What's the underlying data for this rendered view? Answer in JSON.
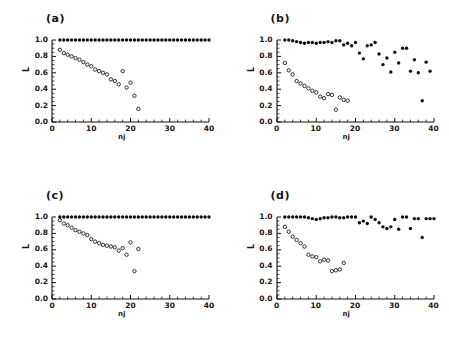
{
  "figure": {
    "background": "#ffffff",
    "marker_color": "#101010",
    "panels": [
      "a",
      "b",
      "c",
      "d"
    ]
  },
  "chart_data": [
    {
      "type": "scatter",
      "title": "(a)",
      "xlabel": "nj",
      "ylabel": "L",
      "xlim": [
        0,
        40
      ],
      "ylim": [
        0.0,
        1.0
      ],
      "xticks": [
        0,
        10,
        20,
        30,
        40
      ],
      "yticks": [
        "0.0",
        "0.2",
        "0.4",
        "0.6",
        "0.8",
        "1.0"
      ],
      "grid": false,
      "legend": "none",
      "series": [
        {
          "name": "filled",
          "marker": "filled-circle",
          "x": [
            2,
            3,
            4,
            5,
            6,
            7,
            8,
            9,
            10,
            11,
            12,
            13,
            14,
            15,
            16,
            17,
            18,
            19,
            20,
            21,
            22,
            23,
            24,
            25,
            26,
            27,
            28,
            29,
            30,
            31,
            32,
            33,
            34,
            35,
            36,
            37,
            38,
            39,
            40
          ],
          "y": [
            1.0,
            1.0,
            1.0,
            1.0,
            1.0,
            1.0,
            1.0,
            1.0,
            1.0,
            1.0,
            1.0,
            1.0,
            1.0,
            1.0,
            1.0,
            1.0,
            1.0,
            1.0,
            1.0,
            1.0,
            1.0,
            1.0,
            1.0,
            1.0,
            1.0,
            1.0,
            1.0,
            1.0,
            1.0,
            1.0,
            1.0,
            1.0,
            1.0,
            1.0,
            1.0,
            1.0,
            1.0,
            1.0,
            1.0
          ]
        },
        {
          "name": "open",
          "marker": "open-circle",
          "x": [
            2,
            3,
            4,
            5,
            6,
            7,
            8,
            9,
            10,
            11,
            12,
            13,
            14,
            15,
            16,
            17,
            18,
            19,
            20,
            21,
            22
          ],
          "y": [
            0.88,
            0.84,
            0.82,
            0.8,
            0.78,
            0.76,
            0.73,
            0.7,
            0.68,
            0.64,
            0.62,
            0.6,
            0.58,
            0.52,
            0.5,
            0.46,
            0.62,
            0.42,
            0.48,
            0.32,
            0.16
          ]
        }
      ]
    },
    {
      "type": "scatter",
      "title": "(b)",
      "xlabel": "nj",
      "ylabel": "L",
      "xlim": [
        0,
        40
      ],
      "ylim": [
        0.0,
        1.0
      ],
      "xticks": [
        0,
        10,
        20,
        30,
        40
      ],
      "yticks": [
        "0.0",
        "0.2",
        "0.4",
        "0.6",
        "0.8",
        "1.0"
      ],
      "grid": false,
      "legend": "none",
      "series": [
        {
          "name": "filled",
          "marker": "filled-circle",
          "x": [
            2,
            3,
            4,
            5,
            6,
            7,
            8,
            9,
            10,
            11,
            12,
            13,
            14,
            15,
            16,
            17,
            18,
            19,
            20,
            21,
            22,
            23,
            24,
            25,
            26,
            27,
            28,
            29,
            30,
            31,
            32,
            33,
            34,
            35,
            36,
            37,
            38,
            39
          ],
          "y": [
            1.0,
            1.0,
            0.99,
            0.98,
            0.97,
            0.96,
            0.97,
            0.97,
            0.96,
            0.97,
            0.97,
            0.98,
            0.97,
            0.99,
            0.99,
            0.94,
            0.96,
            0.93,
            0.97,
            0.84,
            0.77,
            0.93,
            0.94,
            0.97,
            0.83,
            0.7,
            0.78,
            0.61,
            0.85,
            0.72,
            0.9,
            0.9,
            0.62,
            0.76,
            0.6,
            0.26,
            0.73,
            0.62
          ]
        },
        {
          "name": "open",
          "marker": "open-circle",
          "x": [
            2,
            3,
            4,
            5,
            6,
            7,
            8,
            9,
            10,
            11,
            12,
            13,
            14,
            15,
            16,
            17,
            18
          ],
          "y": [
            0.72,
            0.63,
            0.58,
            0.5,
            0.47,
            0.44,
            0.41,
            0.38,
            0.36,
            0.31,
            0.29,
            0.34,
            0.33,
            0.15,
            0.3,
            0.27,
            0.26
          ]
        }
      ]
    },
    {
      "type": "scatter",
      "title": "(c)",
      "xlabel": "nj",
      "ylabel": "L",
      "xlim": [
        0,
        40
      ],
      "ylim": [
        0.0,
        1.0
      ],
      "xticks": [
        0,
        10,
        20,
        30,
        40
      ],
      "yticks": [
        "0.0",
        "0.2",
        "0.4",
        "0.6",
        "0.8",
        "1.0"
      ],
      "grid": false,
      "legend": "none",
      "series": [
        {
          "name": "filled",
          "marker": "filled-circle",
          "x": [
            2,
            3,
            4,
            5,
            6,
            7,
            8,
            9,
            10,
            11,
            12,
            13,
            14,
            15,
            16,
            17,
            18,
            19,
            20,
            21,
            22,
            23,
            24,
            25,
            26,
            27,
            28,
            29,
            30,
            31,
            32,
            33,
            34,
            35,
            36,
            37,
            38,
            39,
            40
          ],
          "y": [
            1.0,
            1.0,
            1.0,
            1.0,
            1.0,
            1.0,
            1.0,
            1.0,
            1.0,
            1.0,
            1.0,
            1.0,
            1.0,
            1.0,
            1.0,
            1.0,
            1.0,
            1.0,
            1.0,
            1.0,
            1.0,
            1.0,
            1.0,
            1.0,
            1.0,
            1.0,
            1.0,
            1.0,
            1.0,
            1.0,
            1.0,
            1.0,
            1.0,
            1.0,
            1.0,
            1.0,
            1.0,
            1.0,
            1.0
          ]
        },
        {
          "name": "open",
          "marker": "open-circle",
          "x": [
            2,
            3,
            4,
            5,
            6,
            7,
            8,
            9,
            10,
            11,
            12,
            13,
            14,
            15,
            16,
            17,
            18,
            19,
            20,
            21,
            22
          ],
          "y": [
            0.96,
            0.92,
            0.9,
            0.87,
            0.84,
            0.82,
            0.8,
            0.78,
            0.73,
            0.7,
            0.68,
            0.66,
            0.65,
            0.64,
            0.63,
            0.59,
            0.62,
            0.54,
            0.69,
            0.34,
            0.61
          ]
        }
      ]
    },
    {
      "type": "scatter",
      "title": "(d)",
      "xlabel": "nj",
      "ylabel": "L",
      "xlim": [
        0,
        40
      ],
      "ylim": [
        0.0,
        1.0
      ],
      "xticks": [
        0,
        10,
        20,
        30,
        40
      ],
      "yticks": [
        "0.0",
        "0.2",
        "0.4",
        "0.6",
        "0.8",
        "1.0"
      ],
      "grid": false,
      "legend": "none",
      "series": [
        {
          "name": "filled",
          "marker": "filled-circle",
          "x": [
            2,
            3,
            4,
            5,
            6,
            7,
            8,
            9,
            10,
            11,
            12,
            13,
            14,
            15,
            16,
            17,
            18,
            19,
            20,
            21,
            22,
            23,
            24,
            25,
            26,
            27,
            28,
            29,
            30,
            31,
            32,
            33,
            34,
            35,
            36,
            37,
            38,
            39,
            40
          ],
          "y": [
            1.0,
            1.0,
            1.0,
            1.0,
            1.0,
            1.0,
            0.99,
            0.98,
            0.97,
            0.98,
            0.99,
            0.99,
            1.0,
            1.0,
            0.99,
            0.99,
            1.0,
            1.0,
            1.0,
            0.93,
            0.95,
            0.92,
            1.0,
            0.97,
            0.93,
            0.88,
            0.86,
            0.88,
            0.97,
            0.85,
            1.0,
            1.0,
            0.86,
            0.98,
            0.98,
            0.75,
            0.98,
            0.98,
            0.98
          ]
        },
        {
          "name": "open",
          "marker": "open-circle",
          "x": [
            2,
            3,
            4,
            5,
            6,
            7,
            8,
            9,
            10,
            11,
            12,
            13,
            14,
            15,
            16,
            17
          ],
          "y": [
            0.88,
            0.82,
            0.76,
            0.72,
            0.68,
            0.64,
            0.54,
            0.52,
            0.51,
            0.46,
            0.48,
            0.47,
            0.34,
            0.35,
            0.36,
            0.44
          ]
        }
      ]
    }
  ]
}
